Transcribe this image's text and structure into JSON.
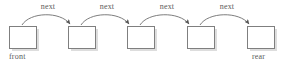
{
  "diagram": {
    "type": "linked-list",
    "canvas": {
      "width": 290,
      "height": 68,
      "background": "#ffffff"
    },
    "style": {
      "node_fill": "#ffffff",
      "node_stroke": "#7f7f7f",
      "node_stroke_width": 1,
      "shadow_color": "#c8c8c8",
      "arrow_color": "#6e6e6e",
      "text_color": "#5a5a5a"
    },
    "nodes": [
      {
        "id": "n1",
        "x": 9,
        "y": 26,
        "w": 27,
        "h": 22,
        "label": ""
      },
      {
        "id": "n2",
        "x": 68,
        "y": 26,
        "w": 27,
        "h": 22,
        "label": ""
      },
      {
        "id": "n3",
        "x": 127,
        "y": 26,
        "w": 27,
        "h": 22,
        "label": ""
      },
      {
        "id": "n4",
        "x": 187,
        "y": 26,
        "w": 27,
        "h": 22,
        "label": ""
      },
      {
        "id": "n5",
        "x": 247,
        "y": 26,
        "w": 27,
        "h": 22,
        "label": ""
      }
    ],
    "edges": [
      {
        "from": "n1",
        "to": "n2",
        "label": "next",
        "label_x": 48,
        "label_y": 2
      },
      {
        "from": "n2",
        "to": "n3",
        "label": "next",
        "label_x": 107,
        "label_y": 2
      },
      {
        "from": "n3",
        "to": "n4",
        "label": "next",
        "label_x": 167,
        "label_y": 2
      },
      {
        "from": "n4",
        "to": "n5",
        "label": "next",
        "label_x": 227,
        "label_y": 2
      }
    ],
    "pointers": [
      {
        "name": "front",
        "label": "front",
        "x": 9,
        "y": 52,
        "target": "n1"
      },
      {
        "name": "rear",
        "label": "rear",
        "x": 252,
        "y": 52,
        "target": "n5"
      }
    ]
  }
}
